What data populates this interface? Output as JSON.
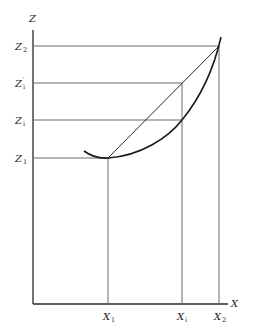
{
  "diagram": {
    "axes": {
      "x_label": "X",
      "y_label": "Z"
    },
    "z_labels": [
      {
        "base": "Z",
        "prime": "",
        "sub": "2",
        "y": 46
      },
      {
        "base": "Z",
        "prime": "′",
        "sub": "i",
        "y": 83
      },
      {
        "base": "Z",
        "prime": "",
        "sub": "i",
        "y": 120
      },
      {
        "base": "Z",
        "prime": "",
        "sub": "1",
        "y": 158
      }
    ],
    "x_labels": [
      {
        "base": "X",
        "sub": "1",
        "x": 108
      },
      {
        "base": "X",
        "sub": "i",
        "x": 182
      },
      {
        "base": "X",
        "sub": "2",
        "x": 219
      }
    ],
    "geometry": {
      "origin": [
        33,
        304
      ],
      "axis_top": 30,
      "axis_right": 228,
      "curve": "convex curve from (84,151) through minimum (108,158), passing (182,120), ending above (219,46) at (221,37)",
      "chord": "straight line from (X1,Z1) to (X2,Z2)"
    }
  }
}
